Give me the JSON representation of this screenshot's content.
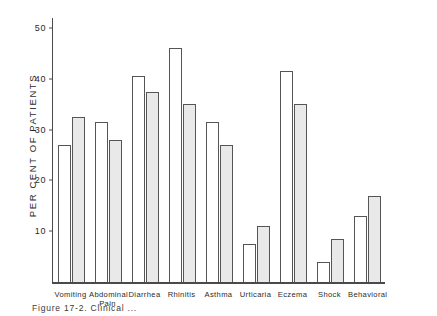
{
  "figure": {
    "caption": "Figure 17-2.  Clinical ...",
    "ylabel": "PER CENT OF PATIENTS"
  },
  "chart_data": {
    "type": "bar",
    "title": "",
    "xlabel": "",
    "ylabel": "PER CENT OF PATIENTS",
    "ylim": [
      0,
      52
    ],
    "yticks": [
      10,
      20,
      30,
      40,
      50
    ],
    "ytick_labels": [
      "10",
      "20",
      "30",
      "40",
      "50"
    ],
    "grid": false,
    "legend": "none",
    "categories": [
      "Vomiting",
      "Abdominal\nPain",
      "Diarrhea",
      "Rhinitis",
      "Asthma",
      "Urticaria",
      "Eczema",
      "Shock",
      "Behavioral"
    ],
    "series": [
      {
        "name": "open",
        "style": "white-outlined",
        "values": [
          27.0,
          31.5,
          40.5,
          46.0,
          31.5,
          7.5,
          41.5,
          4.0,
          13.0
        ]
      },
      {
        "name": "shaded",
        "style": "gray-filled",
        "values": [
          32.5,
          28.0,
          37.5,
          35.0,
          27.0,
          11.0,
          35.0,
          8.5,
          17.0
        ]
      }
    ]
  },
  "colors": {
    "axis": "#4a4a4a",
    "bar_open_fill": "#ffffff",
    "bar_shaded_fill": "#e9e9e9",
    "bar_stroke": "#555555",
    "text": "#2b2b2b",
    "background": "#ffffff"
  }
}
